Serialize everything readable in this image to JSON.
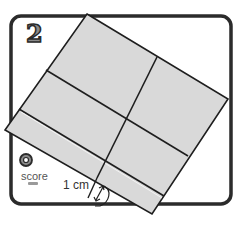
{
  "step": {
    "number": "2"
  },
  "score": {
    "label": "score",
    "value": "—"
  },
  "measurement": {
    "label": "1 cm"
  },
  "colors": {
    "frame_border": "#2b2b2b",
    "paper_fill": "#d9d9d9",
    "line": "#1e1e1e",
    "background": "#ffffff",
    "score_icon": "#3a3a3a"
  }
}
